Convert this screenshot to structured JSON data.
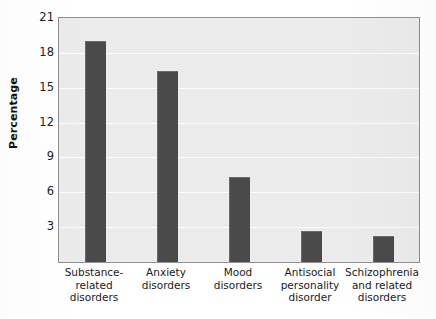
{
  "chart_data": {
    "type": "bar",
    "title": "",
    "xlabel": "",
    "ylabel": "Percentage",
    "categories": [
      "Substance-\nrelated\ndisorders",
      "Anxiety\ndisorders",
      "Mood\ndisorders",
      "Antisocial\npersonality\ndisorder",
      "Schizophrenia\nand related\ndisorders"
    ],
    "category_lines": [
      [
        "Substance-",
        "related",
        "disorders"
      ],
      [
        "Anxiety",
        "disorders"
      ],
      [
        "Mood",
        "disorders"
      ],
      [
        "Antisocial",
        "personality",
        "disorder"
      ],
      [
        "Schizophrenia",
        "and related",
        "disorders"
      ]
    ],
    "values": [
      19.0,
      16.4,
      7.3,
      2.7,
      2.2
    ],
    "ylim": [
      0,
      21
    ],
    "yticks": [
      3,
      6,
      9,
      12,
      15,
      18,
      21
    ],
    "ytick_labels": [
      "3",
      "6",
      "9",
      "12",
      "15",
      "18",
      "21"
    ],
    "grid": true,
    "grid_axis": "y",
    "legend": null,
    "bar_color": "#4a4a4a",
    "plot_background": "#ebebeb",
    "gridline_color": "#fbfbfb",
    "axis_border_color": "#8f8f8f",
    "page_background": "#ffffff"
  }
}
